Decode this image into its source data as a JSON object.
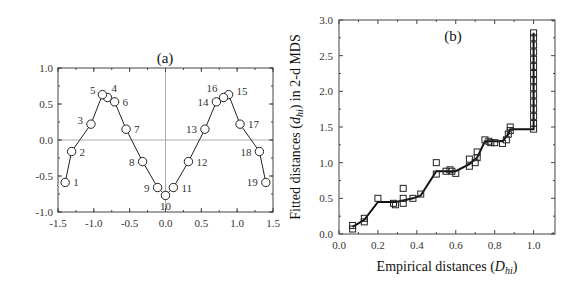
{
  "chart_data": [
    {
      "type": "line",
      "title": "(a)",
      "xlabel": "",
      "ylabel": "",
      "xlim": [
        -1.5,
        1.5
      ],
      "ylim": [
        -1.0,
        1.0
      ],
      "xticks": [
        "-1.5",
        "-1.0",
        "-0.5",
        "0.0",
        "0.5",
        "1.0",
        "1.5"
      ],
      "yticks": [
        "1.0",
        "0.5",
        "0.0",
        "-0.5",
        "-1.0"
      ],
      "grid": false,
      "reference_lines": {
        "x": 0.0,
        "y": 0.0
      },
      "marker": "open-circle",
      "path_order": [
        1,
        2,
        3,
        5,
        4,
        6,
        7,
        8,
        9,
        10,
        11,
        12,
        13,
        14,
        16,
        15,
        17,
        18,
        19
      ],
      "points": [
        {
          "label": "1",
          "x": -1.4,
          "y": -0.59
        },
        {
          "label": "2",
          "x": -1.31,
          "y": -0.16
        },
        {
          "label": "3",
          "x": -1.04,
          "y": 0.22
        },
        {
          "label": "4",
          "x": -0.81,
          "y": 0.59
        },
        {
          "label": "5",
          "x": -0.88,
          "y": 0.63
        },
        {
          "label": "6",
          "x": -0.71,
          "y": 0.53
        },
        {
          "label": "7",
          "x": -0.55,
          "y": 0.15
        },
        {
          "label": "8",
          "x": -0.32,
          "y": -0.3
        },
        {
          "label": "9",
          "x": -0.11,
          "y": -0.66
        },
        {
          "label": "10",
          "x": 0.0,
          "y": -0.77
        },
        {
          "label": "11",
          "x": 0.11,
          "y": -0.66
        },
        {
          "label": "12",
          "x": 0.32,
          "y": -0.3
        },
        {
          "label": "13",
          "x": 0.55,
          "y": 0.15
        },
        {
          "label": "14",
          "x": 0.71,
          "y": 0.53
        },
        {
          "label": "15",
          "x": 0.88,
          "y": 0.63
        },
        {
          "label": "16",
          "x": 0.81,
          "y": 0.59
        },
        {
          "label": "17",
          "x": 1.04,
          "y": 0.22
        },
        {
          "label": "18",
          "x": 1.31,
          "y": -0.16
        },
        {
          "label": "19",
          "x": 1.4,
          "y": -0.59
        }
      ]
    },
    {
      "type": "scatter",
      "title": "(b)",
      "xlabel": "Empirical distances (D_hi)",
      "ylabel": "Fitted distances (d_hi) in 2-d MDS",
      "xlim": [
        0.0,
        1.11
      ],
      "ylim": [
        0.0,
        3.0
      ],
      "xticks": [
        "0.0",
        "0.2",
        "0.4",
        "0.6",
        "0.8",
        "1.0"
      ],
      "yticks": [
        "0.0",
        "0.5",
        "1.0",
        "1.5",
        "2.0",
        "2.5",
        "3.0"
      ],
      "grid": false,
      "marker": "open-square",
      "series": [
        {
          "name": "fitted distances",
          "points": [
            [
              0.07,
              0.07
            ],
            [
              0.07,
              0.12
            ],
            [
              0.13,
              0.17
            ],
            [
              0.13,
              0.22
            ],
            [
              0.2,
              0.5
            ],
            [
              0.28,
              0.43
            ],
            [
              0.29,
              0.41
            ],
            [
              0.33,
              0.43
            ],
            [
              0.33,
              0.5
            ],
            [
              0.33,
              0.64
            ],
            [
              0.38,
              0.5
            ],
            [
              0.42,
              0.56
            ],
            [
              0.5,
              0.84
            ],
            [
              0.5,
              1.0
            ],
            [
              0.55,
              0.88
            ],
            [
              0.57,
              0.9
            ],
            [
              0.58,
              0.88
            ],
            [
              0.6,
              0.85
            ],
            [
              0.67,
              0.95
            ],
            [
              0.67,
              1.05
            ],
            [
              0.7,
              1.0
            ],
            [
              0.71,
              1.07
            ],
            [
              0.71,
              1.15
            ],
            [
              0.75,
              1.32
            ],
            [
              0.77,
              1.3
            ],
            [
              0.78,
              1.28
            ],
            [
              0.8,
              1.28
            ],
            [
              0.84,
              1.27
            ],
            [
              0.86,
              1.32
            ],
            [
              0.87,
              1.4
            ],
            [
              0.88,
              1.45
            ],
            [
              0.88,
              1.5
            ],
            [
              1.0,
              1.47
            ],
            [
              1.0,
              1.55
            ],
            [
              1.0,
              1.65
            ],
            [
              1.0,
              1.75
            ],
            [
              1.0,
              1.85
            ],
            [
              1.0,
              1.95
            ],
            [
              1.0,
              2.05
            ],
            [
              1.0,
              2.15
            ],
            [
              1.0,
              2.25
            ],
            [
              1.0,
              2.35
            ],
            [
              1.0,
              2.45
            ],
            [
              1.0,
              2.55
            ],
            [
              1.0,
              2.65
            ],
            [
              1.0,
              2.75
            ],
            [
              1.0,
              2.82
            ]
          ]
        },
        {
          "name": "monotone regression",
          "type": "step-line",
          "points": [
            [
              0.07,
              0.1
            ],
            [
              0.13,
              0.2
            ],
            [
              0.2,
              0.45
            ],
            [
              0.29,
              0.45
            ],
            [
              0.33,
              0.47
            ],
            [
              0.38,
              0.5
            ],
            [
              0.42,
              0.54
            ],
            [
              0.5,
              0.88
            ],
            [
              0.6,
              0.88
            ],
            [
              0.67,
              0.98
            ],
            [
              0.71,
              1.07
            ],
            [
              0.75,
              1.3
            ],
            [
              0.84,
              1.3
            ],
            [
              0.87,
              1.4
            ],
            [
              0.88,
              1.47
            ],
            [
              1.0,
              1.47
            ],
            [
              1.0,
              2.82
            ]
          ]
        }
      ]
    }
  ],
  "panel_a": {
    "title": "(a)",
    "xticks": [
      "-1.5",
      "-1.0",
      "-0.5",
      "0.0",
      "0.5",
      "1.0",
      "1.5"
    ],
    "yticks": [
      "1.0",
      "0.5",
      "0.0",
      "-0.5",
      "-1.0"
    ]
  },
  "panel_b": {
    "title": "(b)",
    "xticks": [
      "0.0",
      "0.2",
      "0.4",
      "0.6",
      "0.8",
      "1.0"
    ],
    "yticks": [
      "0.0",
      "0.5",
      "1.0",
      "1.5",
      "2.0",
      "2.5",
      "3.0"
    ],
    "xlabel_main": "Empirical distances (",
    "xlabel_sym": "D",
    "xlabel_sub": "hi",
    "xlabel_end": ")",
    "ylabel_main": "Fitted distances (",
    "ylabel_sym": "d",
    "ylabel_sub": "hi",
    "ylabel_end": ") in 2-d MDS"
  }
}
